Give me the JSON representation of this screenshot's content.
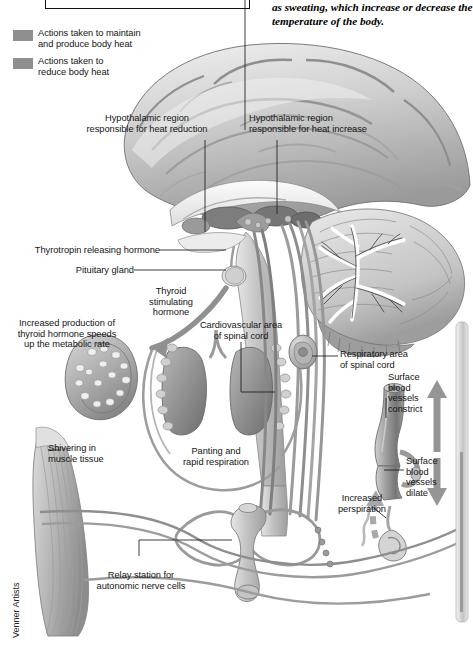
{
  "figure": {
    "caption_fragment": "as sweating, which increase or decrease the\ntemperature of the body.",
    "credit": "Venner Artists"
  },
  "legend": {
    "items": [
      {
        "label": "Actions taken to maintain\nand produce body heat",
        "swatch_color": "#8f8f8f"
      },
      {
        "label": "Actions taken to\nreduce body heat",
        "swatch_color": "#8f8f8f"
      }
    ]
  },
  "labels": {
    "heat_reduction": "Hypothalamic region\nresponsible for heat reduction",
    "heat_increase": "Hypothalamic region\nresponsible for heat increase",
    "trh": "Thyrotropin releasing hormone",
    "pituitary": "Pituitary gland",
    "tsh": "Thyroid\nstimulating\nhormone",
    "thyroid_effect": "Increased production of\nthyroid hormone speeds\nup the metabolic rate",
    "cardiovascular": "Cardiovascular area\nof spinal cord",
    "respiratory": "Respiratory area\nof spinal cord",
    "vessels_constrict": "Surface\nblood\nvessels\nconstrict",
    "vessels_dilate": "Surface\nblood\nvessels\ndilate",
    "perspiration": "Increased\nperspiration",
    "shivering": "Shivering in\nmuscle tissue",
    "panting": "Panting and\nrapid respiration",
    "relay": "Relay station for\nautonomic nerve cells"
  },
  "colors": {
    "ink": "#151515",
    "leader": "#1a1a1a",
    "tissue_light": "#e3e3e3",
    "tissue_mid": "#bdbdbd",
    "tissue_dark": "#8d8d8d",
    "nerve_warm": "#a0a0a0",
    "nerve_cool": "#8a8a8a",
    "background": "#ffffff"
  }
}
